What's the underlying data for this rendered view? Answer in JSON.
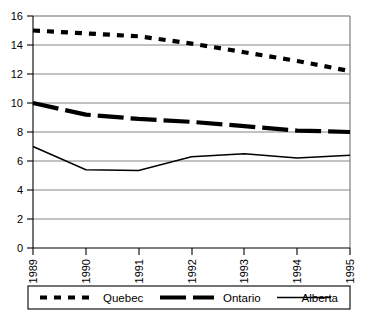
{
  "chart_data": {
    "type": "line",
    "title": "",
    "xlabel": "",
    "ylabel": "",
    "x": [
      1989,
      1990,
      1991,
      1992,
      1993,
      1994,
      1995
    ],
    "categories": [
      "1989",
      "1990",
      "1991",
      "1992",
      "1993",
      "1994",
      "1995"
    ],
    "xlim": [
      1989,
      1995
    ],
    "ylim": [
      0,
      16
    ],
    "yticks": [
      0,
      2,
      4,
      6,
      8,
      10,
      12,
      14,
      16
    ],
    "ytick_labels": [
      "0",
      "2",
      "4",
      "6",
      "8",
      "10",
      "12",
      "14",
      "16"
    ],
    "grid": true,
    "grid_axis": "y",
    "legend_position": "bottom",
    "series": [
      {
        "name": "Quebec",
        "style": "thick-dashed",
        "color": "#000000",
        "values": [
          15.0,
          14.8,
          14.6,
          14.1,
          13.5,
          12.9,
          12.2
        ]
      },
      {
        "name": "Ontario",
        "style": "thick-dashed-long",
        "color": "#000000",
        "values": [
          10.0,
          9.2,
          8.9,
          8.7,
          8.4,
          8.1,
          8.0
        ]
      },
      {
        "name": "Alberta",
        "style": "thin-solid",
        "color": "#000000",
        "values": [
          7.0,
          5.4,
          5.35,
          6.3,
          6.5,
          6.2,
          6.4
        ]
      }
    ]
  },
  "axes": {
    "y_tick_0": "0",
    "y_tick_1": "2",
    "y_tick_2": "4",
    "y_tick_3": "6",
    "y_tick_4": "8",
    "y_tick_5": "10",
    "y_tick_6": "12",
    "y_tick_7": "14",
    "y_tick_8": "16",
    "x_tick_0": "1989",
    "x_tick_1": "1990",
    "x_tick_2": "1991",
    "x_tick_3": "1992",
    "x_tick_4": "1993",
    "x_tick_5": "1994",
    "x_tick_6": "1995"
  },
  "legend": {
    "items": [
      {
        "label": "Quebec"
      },
      {
        "label": "Ontario"
      },
      {
        "label": "Alberta"
      }
    ]
  }
}
